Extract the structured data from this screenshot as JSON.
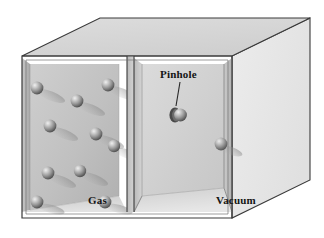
{
  "figure": {
    "type": "effusion-diagram",
    "title_visible": false,
    "background_color": "#ffffff",
    "outline_color": "#2b2b2b"
  },
  "labels": {
    "pinhole": "Pinhole",
    "gas": "Gas",
    "vacuum": "Vacuum"
  },
  "colors": {
    "top_face": "#d7d7d7",
    "right_face": "#e9e9e9",
    "left_chamber_back": "#c2c2c2",
    "left_chamber_side": "#b4b4b4",
    "left_chamber_floor": "#dcdcdc",
    "right_chamber_back": "#d2d2d2",
    "right_chamber_side": "#bdbdbd",
    "right_chamber_floor": "#e2e2e2",
    "divider_light": "#cfcfcf",
    "divider_dark": "#9a9a9a",
    "sphere_light": "#d8d8d8",
    "sphere_mid": "#9e9e9e",
    "sphere_dark": "#5c5c5c",
    "shadow": "#8f8f8f",
    "edge_line": "#3a3a3a",
    "leader_line": "#262626"
  },
  "box": {
    "front_left_x": 22,
    "front_right_x": 232,
    "front_top_y": 56,
    "front_bottom_y": 218,
    "depth_dx": 78,
    "depth_dy": -38
  },
  "chambers": [
    {
      "name": "gas",
      "label": "Gas",
      "x_start": 22,
      "x_end": 127,
      "contains": "gas molecules"
    },
    {
      "name": "vacuum",
      "label": "Vacuum",
      "x_start": 133,
      "x_end": 232,
      "contains": "vacuum"
    }
  ],
  "divider": {
    "x_front_left": 127,
    "x_front_right": 134,
    "pinhole_y": 114
  },
  "pinhole": {
    "label": "Pinhole",
    "hole_x": 176,
    "hole_y": 115,
    "hole_rx": 5,
    "hole_ry": 7,
    "leader": {
      "x1": 180,
      "y1": 82,
      "x2": 176,
      "y2": 106
    }
  },
  "molecules": {
    "radius": 6.2,
    "gas_chamber": [
      {
        "cx": 37,
        "cy": 88
      },
      {
        "cx": 108,
        "cy": 85
      },
      {
        "cx": 77,
        "cy": 101
      },
      {
        "cx": 50,
        "cy": 126
      },
      {
        "cx": 96,
        "cy": 134
      },
      {
        "cx": 48,
        "cy": 173
      },
      {
        "cx": 114,
        "cy": 146
      },
      {
        "cx": 80,
        "cy": 171
      },
      {
        "cx": 37,
        "cy": 202
      },
      {
        "cx": 105,
        "cy": 202
      }
    ],
    "vacuum_chamber": [
      {
        "cx": 220,
        "cy": 144
      }
    ],
    "at_pinhole": [
      {
        "cx": 180,
        "cy": 115
      }
    ]
  },
  "annotations": {
    "description": "Gas molecules effusing through a pinhole from a gas-filled chamber into an evacuated chamber"
  }
}
